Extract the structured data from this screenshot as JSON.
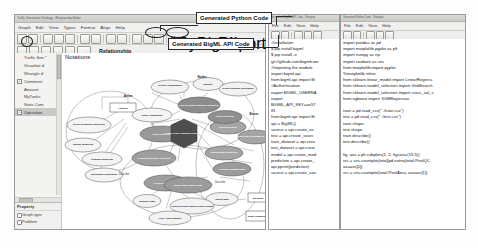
{
  "diagram_window": {
    "title": "Traffic Simulation Ontology - Relationship Editor",
    "menu": [
      "Graph",
      "Edit",
      "View",
      "Types",
      "Format",
      "Align",
      "Help"
    ],
    "mode_label": "Relationship",
    "canvas_title": "Notations",
    "toolbar_buttons": [
      "save-icon",
      "print-icon",
      "cut-icon",
      "copy-icon",
      "paste-icon",
      "undo-icon",
      "redo-icon",
      "move-icon",
      "rotate-icon",
      "zoom-icon",
      "rectangle-icon",
      "table-icon",
      "delete-icon"
    ],
    "circled_buttons": [
      "Python Code",
      "BigML Code",
      "Report"
    ],
    "tree": {
      "items": [
        {
          "label": "Traffic Sim *",
          "expandable": false,
          "selected": false
        },
        {
          "label": "Visualize d",
          "expandable": false,
          "selected": false
        },
        {
          "label": "Wrangle d",
          "expandable": false,
          "selected": false
        },
        {
          "label": "Comment",
          "expandable": true,
          "selected": false
        },
        {
          "label": "Amount",
          "expandable": false,
          "selected": false
        },
        {
          "label": "MyTanks",
          "expandable": false,
          "selected": false
        },
        {
          "label": "Stats Com",
          "expandable": false,
          "selected": false
        },
        {
          "label": "Operation",
          "expandable": true,
          "selected": true
        }
      ]
    },
    "property_panel": {
      "header": "Property",
      "rows": [
        "Graph type",
        "Problem"
      ]
    }
  },
  "callouts": {
    "python": "Generated Python Code",
    "bigml": "Generated BigML API Code"
  },
  "graph": {
    "group_labels": [
      "Arrive",
      "Nodes",
      "Describe",
      "Boxes",
      "Describe"
    ],
    "nodes": [
      {
        "id": "n1",
        "label": "Result Visualization",
        "shape": "ellipse",
        "fill": "light"
      },
      {
        "id": "n2",
        "label": "Monitor",
        "shape": "ellipse",
        "fill": "light"
      },
      {
        "id": "n3",
        "label": "React Realtime calibration",
        "shape": "ellipse",
        "fill": "light"
      },
      {
        "id": "n4",
        "label": "Live predictive/analytic prototype",
        "shape": "ellipse",
        "fill": "dark"
      },
      {
        "id": "n5",
        "label": "Amount",
        "shape": "rect",
        "fill": "white"
      },
      {
        "id": "n6",
        "label": "Traffic Simulation",
        "shape": "ellipse",
        "fill": "light"
      },
      {
        "id": "n7",
        "label": "Driver behaviour modeling",
        "shape": "ellipse",
        "fill": "light"
      },
      {
        "id": "n8",
        "label": "Supply modeling",
        "shape": "ellipse",
        "fill": "light"
      },
      {
        "id": "n9",
        "label": "Demand modeling",
        "shape": "ellipse",
        "fill": "light"
      },
      {
        "id": "n10",
        "label": "Intermodal Simulation",
        "shape": "ellipse",
        "fill": "light"
      },
      {
        "id": "n11",
        "label": "Traffic Modelling",
        "shape": "ellipse",
        "fill": "dark"
      },
      {
        "id": "n12",
        "label": "Origin-destination inference",
        "shape": "ellipse",
        "fill": "dark"
      },
      {
        "id": "n13",
        "label": "Origin-Operand data",
        "shape": "ellipse",
        "fill": "dark"
      },
      {
        "id": "n14",
        "label": "Traffic Flow Analytical Research",
        "shape": "hex",
        "fill": "darkest"
      },
      {
        "id": "n15",
        "label": "Region Search",
        "shape": "ellipse",
        "fill": "dark"
      },
      {
        "id": "n16",
        "label": "Sensor data collection",
        "shape": "ellipse",
        "fill": "dark"
      },
      {
        "id": "n17",
        "label": "Define the performance metrics",
        "shape": "ellipse",
        "fill": "dark"
      },
      {
        "id": "n18",
        "label": "Data collection",
        "shape": "ellipse",
        "fill": "dark"
      },
      {
        "id": "n19",
        "label": "Provide realtime data",
        "shape": "ellipse",
        "fill": "dark"
      },
      {
        "id": "n20",
        "label": "Traffic data engineering",
        "shape": "ellipse",
        "fill": "dark"
      },
      {
        "id": "n21",
        "label": "Ingest data",
        "shape": "ellipse",
        "fill": "light"
      },
      {
        "id": "n22",
        "label": "Wrangle data",
        "shape": "ellipse",
        "fill": "light"
      },
      {
        "id": "n23",
        "label": "Convert binary data to open format",
        "shape": "ellipse",
        "fill": "light"
      },
      {
        "id": "n24",
        "label": "Filter / split dataset",
        "shape": "ellipse",
        "fill": "light"
      },
      {
        "id": "n25",
        "label": "MyTanks",
        "shape": "rect",
        "fill": "white"
      },
      {
        "id": "n26",
        "label": "Stats Comment",
        "shape": "rect",
        "fill": "white"
      }
    ]
  },
  "bigml_window": {
    "title": "Generated BigML API Code - Notepad",
    "menu": [
      "File",
      "Edit",
      "View",
      "Help"
    ],
    "code": [
      "#Installation",
      "$ pip install bigml",
      "$ pip install -e",
      "git://github.com/bigmlcom",
      "#Importing the module",
      "import bigml.api",
      "from bigml.api import Bi",
      "#Authentication",
      "export BIGML_USERNA",
      "export",
      "BIGML_API_KEY=ae57",
      "81",
      "from bigml.api import Bi",
      "api = BigML()",
      "source = api.create_so",
      "test = api.create_sourc",
      "train_dataset = api.crea",
      "test_dataset = api.creat",
      "model = api.create_mod",
      "prediction = api.create_",
      "api.pprint(prediction)",
      "source = api.create_sou"
    ]
  },
  "python_window": {
    "title": "Generated Python Code - Notepad",
    "menu": [
      "File",
      "Edit",
      "View",
      "Help"
    ],
    "code": [
      "import pandas as pd",
      "import matplotlib.pyplot as plt",
      "import numpy as np",
      "import seaborn as sns",
      "from matplotlib import pyplot",
      "%matplotlib inline",
      "from sklearn.linear_model import LinearRegress",
      "from sklearn.model_selection import GridSearch",
      "from sklearn.model_selection import cross_val_s",
      "from xgboost import XGBRegressor",
      "",
      "train = pd.read_csv(\" ./train.csv\")",
      "test = pd.read_csv(\" ./test.csv\")",
      "train.shape",
      "test.shape",
      "train.describe()",
      "test.describe()",
      "",
      "fig, axs = plt.subplots(1, 2, figsize=(15,5))",
      "srs = sns.countplot(total[pd.notna(total.PoolQC",
      "ax=axs[0])",
      "srs = sns.countplot(total.PoolArea, ax=axs[1])"
    ]
  }
}
